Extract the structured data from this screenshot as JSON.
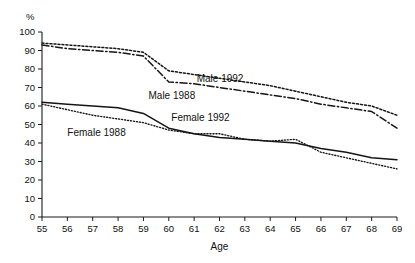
{
  "chart_data": {
    "type": "line",
    "title": "",
    "subtitle": "",
    "xlabel": "Age",
    "ylabel": "%",
    "unit_label": "%",
    "xlim": [
      55,
      69
    ],
    "ylim": [
      0,
      100
    ],
    "grid": false,
    "legend_position": "inline-annotations",
    "x": [
      55,
      56,
      57,
      58,
      59,
      60,
      61,
      62,
      63,
      64,
      65,
      66,
      67,
      68,
      69
    ],
    "xticks": [
      "55",
      "56",
      "57",
      "58",
      "59",
      "60",
      "61",
      "62",
      "63",
      "64",
      "65",
      "66",
      "67",
      "68",
      "69"
    ],
    "yticks": [
      "0",
      "10",
      "20",
      "30",
      "40",
      "50",
      "60",
      "70",
      "80",
      "90",
      "100"
    ],
    "series": [
      {
        "name": "Male 1992",
        "style": "dotted-coarse",
        "label_x": 61.1,
        "label_y": 73,
        "values": [
          94,
          93,
          92,
          91,
          89,
          79,
          77,
          75,
          73,
          71,
          68,
          65,
          62,
          60,
          55
        ]
      },
      {
        "name": "Male 1988",
        "style": "dashdot",
        "label_x": 59.2,
        "label_y": 64,
        "values": [
          93,
          91,
          90,
          89,
          87,
          73,
          72,
          70,
          68,
          66,
          64,
          61,
          59,
          57,
          48
        ]
      },
      {
        "name": "Female 1992",
        "style": "solid",
        "label_x": 60.1,
        "label_y": 52,
        "values": [
          62,
          61,
          60,
          59,
          56,
          48,
          45,
          43,
          42,
          41,
          40,
          37,
          35,
          32,
          31
        ]
      },
      {
        "name": "Female 1988",
        "style": "dotted-fine",
        "label_x": 56.0,
        "label_y": 44,
        "values": [
          61,
          58,
          55,
          53,
          51,
          47,
          45,
          45,
          42,
          41,
          42,
          35,
          32,
          29,
          26
        ]
      }
    ]
  }
}
